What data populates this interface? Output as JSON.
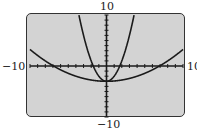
{
  "window": {
    "xmin_label": "−10",
    "xmax_label": "10",
    "ymax_label": "10",
    "ymin_label": "−10"
  },
  "colors": {
    "screen_bg": "#d3d3d3",
    "curve": "#1a1a1a",
    "frame": "#333333"
  },
  "chart_data": {
    "type": "line",
    "title": "",
    "xlabel": "",
    "ylabel": "",
    "xlim": [
      -10,
      10
    ],
    "ylim": [
      -10,
      10
    ],
    "xscale_ticks": 1,
    "yscale_ticks": 1,
    "grid": false,
    "tick_labels": {
      "x": [
        "-10",
        "10"
      ],
      "y": [
        "-10",
        "10"
      ]
    },
    "series": [
      {
        "name": "narrow parabola",
        "equation": "y = x^2 - 3",
        "vertex": [
          0,
          -3
        ],
        "x_intercepts": [
          -1.73,
          1.73
        ],
        "x": [
          -3.6,
          -3,
          -2,
          -1.73,
          -1,
          0,
          1,
          1.73,
          2,
          3,
          3.6
        ],
        "y": [
          9.96,
          6,
          1,
          0,
          -2,
          -3,
          -2,
          0,
          1,
          6,
          9.96
        ]
      },
      {
        "name": "wide parabola",
        "equation": "y = x^2/16 - 3",
        "vertex": [
          0,
          -3
        ],
        "x_intercepts": [
          -6.93,
          6.93
        ],
        "x": [
          -10,
          -8,
          -6.93,
          -4,
          0,
          4,
          6.93,
          8,
          10
        ],
        "y": [
          3.25,
          1,
          0,
          -2,
          -3,
          -2,
          0,
          1,
          3.25
        ]
      }
    ]
  }
}
